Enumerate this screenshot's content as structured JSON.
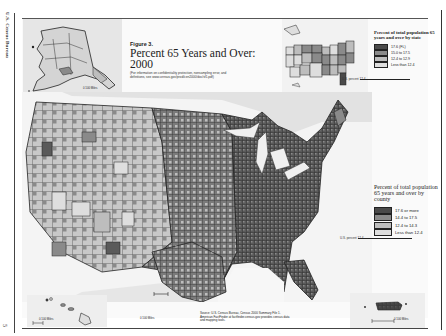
{
  "page": {
    "side_label": "U.S. Census Bureau",
    "page_number": "5"
  },
  "figure": {
    "label": "Figure 3.",
    "title": "Percent 65 Years and Over: 2000",
    "note": "(For information on confidentiality protection, nonsampling error, and definitions, see www.census.gov/prod/cen2000/doc/sf1.pdf)"
  },
  "state_legend": {
    "title": "Percent of total population 65 years and over by state",
    "us_percent_label": "U.S. percent 12.4",
    "classes": [
      {
        "label": "17.6 (FL)",
        "color": "#4a4a4a"
      },
      {
        "label": "15.0 to 17.5",
        "color": "#8a8a8a"
      },
      {
        "label": "12.4 to 12.9",
        "color": "#bdbdbd"
      },
      {
        "label": "Less than 12.4",
        "color": "#dedede"
      }
    ]
  },
  "county_legend": {
    "title": "Percent of total population 65 years and over by county",
    "us_percent_label": "U.S. percent 12.4",
    "classes": [
      {
        "label": "17.6 or more",
        "color": "#4a4a4a"
      },
      {
        "label": "14.4 to 17.5",
        "color": "#8a8a8a"
      },
      {
        "label": "12.4 to 14.3",
        "color": "#bdbdbd"
      },
      {
        "label": "Less than 12.4",
        "color": "#dedede"
      }
    ]
  },
  "source": {
    "text": "Source: U.S. Census Bureau, Census 2000 Summary File 1. American FactFinder at factfinder.census.gov provides census data and mapping tools."
  },
  "insets": {
    "alaska_scale": "0 100 Miles",
    "hawaii_scale": "0 100 Miles",
    "mainland_scale": "0 100 Miles",
    "puerto_rico_scale": "0 100 Miles"
  },
  "colors": {
    "darkest": "#4a4a4a",
    "dark": "#8a8a8a",
    "light": "#bdbdbd",
    "lightest": "#dedede",
    "water": "#f7f7f7",
    "borders": "#222222"
  }
}
